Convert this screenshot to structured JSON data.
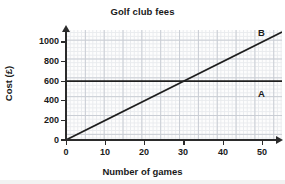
{
  "chart_data": {
    "type": "line",
    "title": "Golf club fees",
    "xlabel": "Number of games",
    "ylabel": "Cost (£)",
    "xlim": [
      0,
      55
    ],
    "ylim": [
      0,
      1120
    ],
    "xticks": [
      0,
      10,
      20,
      30,
      40,
      50
    ],
    "yticks": [
      0,
      200,
      400,
      600,
      800,
      1000
    ],
    "grid": true,
    "legend": "inline-end-labels",
    "series": [
      {
        "name": "A",
        "label": "A",
        "type": "horizontal-line",
        "color": "#1f1f1f",
        "x": [
          0,
          55
        ],
        "values": [
          600,
          600
        ],
        "intercept": 600,
        "slope": 0
      },
      {
        "name": "B",
        "label": "B",
        "type": "line",
        "color": "#1f1f1f",
        "x": [
          0,
          55
        ],
        "values": [
          0,
          1100
        ],
        "intercept": 0,
        "slope": 20
      }
    ],
    "annotations": [
      {
        "text": "A",
        "x": 51,
        "y": 470
      },
      {
        "text": "B",
        "x": 51,
        "y": 1090
      }
    ],
    "intersection": {
      "x": 30,
      "y": 600
    }
  },
  "axes": {
    "x_tick_labels": [
      "0",
      "10",
      "20",
      "30",
      "40",
      "50"
    ],
    "y_tick_labels": [
      "0",
      "200",
      "400",
      "600",
      "800",
      "1000"
    ]
  },
  "colors": {
    "line": "#1f1f1f",
    "axis": "#2b2b2b",
    "grid_minor": "#e9ebee",
    "grid_major": "#c9cdd4",
    "text": "#1a1a1a",
    "background": "#ffffff"
  }
}
